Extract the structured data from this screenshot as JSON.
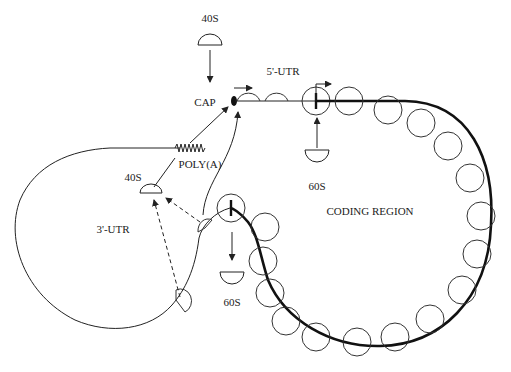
{
  "diagram": {
    "colors": {
      "line": "#222222",
      "background": "#ffffff"
    },
    "labels": {
      "top_40s": "40S",
      "cap": "CAP",
      "utr5": "5'-UTR",
      "poly_a": "POLY(A)",
      "left_40s": "40S",
      "utr3": "3'-UTR",
      "coding_region": "CODING REGION",
      "top_60s": "60S",
      "bottom_60s": "60S"
    },
    "elements": [
      {
        "id": "cap",
        "label": "CAP",
        "shape": "filled-ellipse"
      },
      {
        "id": "subunit-40s-incoming",
        "label": "40S",
        "shape": "dome"
      },
      {
        "id": "subunit-60s-joining",
        "label": "60S",
        "shape": "cup"
      },
      {
        "id": "subunit-60s-released",
        "label": "60S",
        "shape": "cup"
      },
      {
        "id": "subunit-40s-recycled",
        "label": "40S",
        "shape": "dome"
      },
      {
        "id": "poly-a-tail",
        "label": "POLY(A)",
        "shape": "zigzag"
      },
      {
        "id": "coding-region-loop",
        "label": "CODING REGION",
        "shape": "thick-loop-with-ribosomes"
      },
      {
        "id": "utr3-loop",
        "label": "3'-UTR",
        "shape": "thin-loop"
      }
    ]
  }
}
